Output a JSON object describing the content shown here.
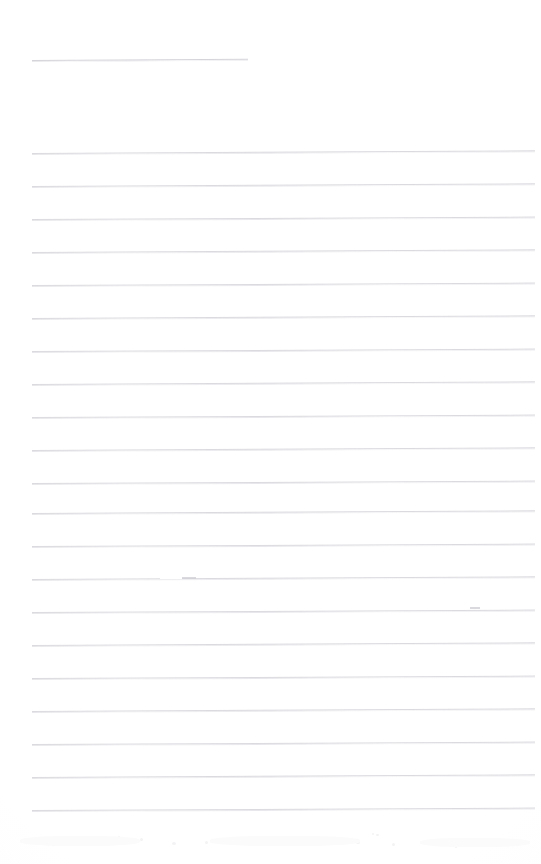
{
  "document": {
    "type": "scanned-lined-notepad-page",
    "title": "",
    "visible_text": "",
    "description": "Blank ruled notepad page scan with no handwriting or printed text",
    "page_width": 541,
    "page_height": 864,
    "background_color": "#fefeff"
  },
  "ruling": {
    "line_color": "#d9d9de",
    "line_thickness_px": 1,
    "line_spacing_px": 33,
    "left_margin_px": 32,
    "right_edge_px": 535,
    "header_rule": {
      "name": "header-rule",
      "x_start": 32,
      "x_end": 248,
      "y": 60,
      "length_px": 216,
      "tilt_deg": -0.35
    },
    "body_rules_count": 21,
    "body_rules": [
      {
        "y": 153,
        "x_start": 32,
        "x_end": 535,
        "tilt_deg": -0.3
      },
      {
        "y": 186,
        "x_start": 32,
        "x_end": 535,
        "tilt_deg": -0.3
      },
      {
        "y": 219,
        "x_start": 32,
        "x_end": 535,
        "tilt_deg": -0.28
      },
      {
        "y": 252,
        "x_start": 32,
        "x_end": 535,
        "tilt_deg": -0.3
      },
      {
        "y": 285,
        "x_start": 32,
        "x_end": 535,
        "tilt_deg": -0.28
      },
      {
        "y": 318,
        "x_start": 32,
        "x_end": 535,
        "tilt_deg": -0.3
      },
      {
        "y": 351,
        "x_start": 32,
        "x_end": 535,
        "tilt_deg": -0.28
      },
      {
        "y": 384,
        "x_start": 32,
        "x_end": 535,
        "tilt_deg": -0.3
      },
      {
        "y": 417,
        "x_start": 32,
        "x_end": 535,
        "tilt_deg": -0.28
      },
      {
        "y": 450,
        "x_start": 32,
        "x_end": 535,
        "tilt_deg": -0.3
      },
      {
        "y": 483,
        "x_start": 32,
        "x_end": 535,
        "tilt_deg": -0.28
      },
      {
        "y": 513,
        "x_start": 32,
        "x_end": 535,
        "tilt_deg": -0.3
      },
      {
        "y": 546,
        "x_start": 32,
        "x_end": 535,
        "tilt_deg": -0.28
      },
      {
        "y": 579,
        "x_start": 32,
        "x_end": 535,
        "tilt_deg": -0.3
      },
      {
        "y": 612,
        "x_start": 32,
        "x_end": 535,
        "tilt_deg": -0.28
      },
      {
        "y": 645,
        "x_start": 32,
        "x_end": 535,
        "tilt_deg": -0.3
      },
      {
        "y": 678,
        "x_start": 32,
        "x_end": 535,
        "tilt_deg": -0.28
      },
      {
        "y": 711,
        "x_start": 32,
        "x_end": 535,
        "tilt_deg": -0.3
      },
      {
        "y": 744,
        "x_start": 32,
        "x_end": 535,
        "tilt_deg": -0.28
      },
      {
        "y": 777,
        "x_start": 32,
        "x_end": 535,
        "tilt_deg": -0.3
      },
      {
        "y": 810,
        "x_start": 32,
        "x_end": 535,
        "tilt_deg": -0.28
      }
    ]
  },
  "margins": {
    "top_blank_px": 60,
    "gap_after_header_px": 93,
    "bottom_blank_px": 54,
    "left_blank_px": 32,
    "right_blank_px": 6
  },
  "artifacts": {
    "description": "Faint scanner noise and small breaks in the ruled lines",
    "line_breaks": [
      {
        "name": "rule-break-1",
        "x": 160,
        "y": 578,
        "width": 22
      },
      {
        "name": "rule-break-2",
        "x": 458,
        "y": 608,
        "width": 12
      }
    ],
    "marks": [
      {
        "name": "rule-tick-1",
        "x": 182,
        "y": 578,
        "width": 14
      },
      {
        "name": "rule-tick-2",
        "x": 470,
        "y": 608,
        "width": 10
      }
    ],
    "bottom_speckles": [
      {
        "x": 28,
        "y": 841,
        "size": 3
      },
      {
        "x": 52,
        "y": 843,
        "size": 4
      },
      {
        "x": 96,
        "y": 840,
        "size": 5
      },
      {
        "x": 140,
        "y": 838,
        "size": 3
      },
      {
        "x": 172,
        "y": 842,
        "size": 4
      },
      {
        "x": 205,
        "y": 841,
        "size": 3
      },
      {
        "x": 248,
        "y": 840,
        "size": 5
      },
      {
        "x": 286,
        "y": 842,
        "size": 4
      },
      {
        "x": 318,
        "y": 839,
        "size": 3
      },
      {
        "x": 356,
        "y": 841,
        "size": 4
      },
      {
        "x": 392,
        "y": 843,
        "size": 3
      },
      {
        "x": 436,
        "y": 840,
        "size": 3
      },
      {
        "x": 470,
        "y": 842,
        "size": 4
      },
      {
        "x": 508,
        "y": 841,
        "size": 3
      },
      {
        "x": 376,
        "y": 834,
        "size": 3
      },
      {
        "x": 300,
        "y": 836,
        "size": 2
      }
    ],
    "faint_specks": [
      {
        "x": 372,
        "y": 833,
        "size": 2
      },
      {
        "x": 455,
        "y": 846,
        "size": 2
      },
      {
        "x": 118,
        "y": 836,
        "size": 2
      }
    ]
  }
}
